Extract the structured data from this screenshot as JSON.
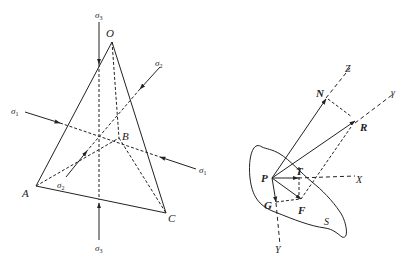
{
  "figure": {
    "left": {
      "title": "stress-tetrahedron",
      "vertices": {
        "O": {
          "label": "O",
          "x": 112,
          "y": 42
        },
        "A": {
          "label": "A",
          "x": 36,
          "y": 186
        },
        "B": {
          "label": "B",
          "x": 119,
          "y": 138
        },
        "C": {
          "label": "C",
          "x": 166,
          "y": 213
        }
      },
      "stress_labels": {
        "sigma3_top": {
          "symbol": "σ",
          "sub": "3"
        },
        "sigma3_bottom": {
          "symbol": "σ",
          "sub": "3"
        },
        "sigma1_left": {
          "symbol": "σ",
          "sub": "1"
        },
        "sigma1_right": {
          "symbol": "σ",
          "sub": "1"
        },
        "sigma2_top": {
          "symbol": "σ",
          "sub": "2"
        },
        "sigma2_bottom": {
          "symbol": "σ",
          "sub": "2"
        }
      }
    },
    "right": {
      "title": "stress-vector-decomposition",
      "points": {
        "P": "P",
        "N": "N",
        "R": "R",
        "T": "T",
        "F": "F",
        "G": "G"
      },
      "axes": {
        "Z": "Z",
        "y": "γ",
        "X": "X",
        "Y": "Y"
      },
      "surface_label": "S"
    },
    "colors": {
      "line": "#222222",
      "background": "#ffffff"
    }
  }
}
